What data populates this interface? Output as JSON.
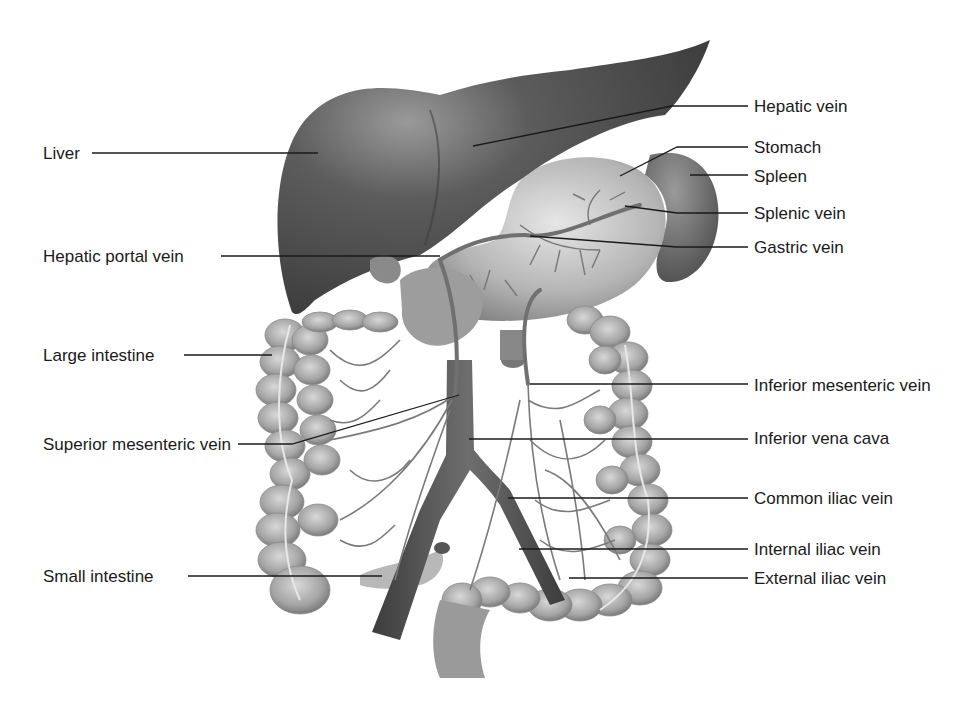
{
  "diagram": {
    "type": "anatomical illustration",
    "palette": {
      "organ_dark": "#4a4a4a",
      "organ_mid": "#8a8a8a",
      "organ_light": "#c4c4c4",
      "vein": "#6a6a6a",
      "leader": "#1a1a1a",
      "text": "#1a1a1a"
    },
    "left_labels": [
      {
        "id": "liver",
        "text": "Liver",
        "x": 43,
        "y": 143,
        "line": [
          [
            92,
            153
          ],
          [
            318,
            153
          ]
        ]
      },
      {
        "id": "hepatic-portal-vein",
        "text": "Hepatic portal vein",
        "x": 43,
        "y": 246,
        "line": [
          [
            221,
            256
          ],
          [
            440,
            256
          ]
        ]
      },
      {
        "id": "large-intestine",
        "text": "Large intestine",
        "x": 43,
        "y": 345,
        "line": [
          [
            184,
            355
          ],
          [
            272,
            355
          ]
        ]
      },
      {
        "id": "superior-mesenteric-vein",
        "text": "Superior mesenteric vein",
        "x": 43,
        "y": 438,
        "line": [
          [
            238,
            444
          ],
          [
            292,
            444
          ],
          [
            459,
            395
          ]
        ]
      },
      {
        "id": "small-intestine",
        "text": "Small intestine",
        "x": 43,
        "y": 568,
        "line": [
          [
            188,
            576
          ],
          [
            382,
            576
          ]
        ]
      }
    ],
    "right_labels": [
      {
        "id": "hepatic-vein",
        "text": "Hepatic vein",
        "x": 754,
        "y": 96,
        "line": [
          [
            748,
            106
          ],
          [
            672,
            106
          ],
          [
            473,
            146
          ]
        ]
      },
      {
        "id": "stomach",
        "text": "Stomach",
        "x": 754,
        "y": 138,
        "line": [
          [
            748,
            147
          ],
          [
            677,
            147
          ],
          [
            620,
            176
          ]
        ]
      },
      {
        "id": "spleen",
        "text": "Spleen",
        "x": 754,
        "y": 167,
        "line": [
          [
            748,
            175
          ],
          [
            690,
            175
          ]
        ]
      },
      {
        "id": "splenic-vein",
        "text": "Splenic vein",
        "x": 754,
        "y": 204,
        "line": [
          [
            748,
            213
          ],
          [
            677,
            213
          ],
          [
            625,
            206
          ]
        ]
      },
      {
        "id": "gastric-vein",
        "text": "Gastric vein",
        "x": 754,
        "y": 238,
        "line": [
          [
            748,
            247
          ],
          [
            677,
            247
          ],
          [
            530,
            236
          ]
        ]
      },
      {
        "id": "inferior-mesenteric-vein",
        "text": "Inferior mesenteric vein",
        "x": 754,
        "y": 376,
        "line": [
          [
            748,
            384
          ],
          [
            530,
            384
          ]
        ]
      },
      {
        "id": "inferior-vena-cava",
        "text": "Inferior vena cava",
        "x": 754,
        "y": 428,
        "line": [
          [
            748,
            439
          ],
          [
            469,
            439
          ]
        ]
      },
      {
        "id": "common-iliac-vein",
        "text": "Common iliac vein",
        "x": 754,
        "y": 488,
        "line": [
          [
            748,
            498
          ],
          [
            508,
            498
          ]
        ]
      },
      {
        "id": "internal-iliac-vein",
        "text": "Internal iliac vein",
        "x": 754,
        "y": 540,
        "line": [
          [
            748,
            549
          ],
          [
            519,
            549
          ]
        ]
      },
      {
        "id": "external-iliac-vein",
        "text": "External iliac vein",
        "x": 754,
        "y": 569,
        "line": [
          [
            748,
            578
          ],
          [
            569,
            578
          ]
        ]
      }
    ]
  }
}
